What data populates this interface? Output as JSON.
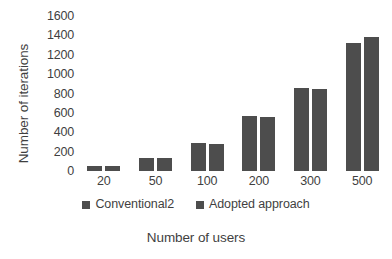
{
  "chart_data": {
    "type": "bar",
    "title": "",
    "xlabel": "Number of users",
    "ylabel": "Number of iterations",
    "categories": [
      "20",
      "50",
      "100",
      "200",
      "300",
      "500"
    ],
    "series": [
      {
        "name": "Conventional2",
        "values": [
          55,
          135,
          290,
          565,
          855,
          1320
        ]
      },
      {
        "name": "Adopted approach",
        "values": [
          50,
          130,
          275,
          555,
          845,
          1380
        ]
      }
    ],
    "ylim": [
      0,
      1600
    ],
    "ytick_values": [
      1600,
      1400,
      1200,
      1000,
      800,
      600,
      400,
      200,
      0
    ],
    "ytick_labels": [
      "1600",
      "1400",
      "1200",
      "1000",
      "800",
      "600",
      "400",
      "200",
      "0"
    ],
    "grid": false,
    "legend_position": "bottom",
    "bar_color": "#4d4d4d",
    "text_color": "#3f3f3f",
    "background": "#ffffff"
  }
}
